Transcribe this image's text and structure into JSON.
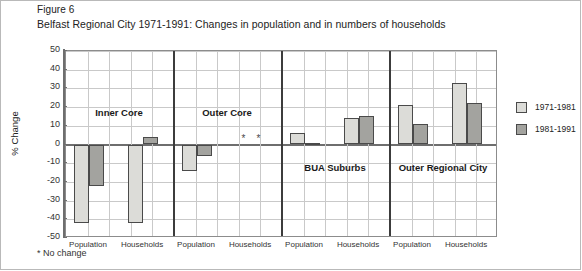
{
  "figure": {
    "number": "Figure 6",
    "title": "Belfast Regional City 1971-1991: Changes in population and in numbers of households",
    "footnote": "* No change"
  },
  "chart_data": {
    "type": "bar",
    "title": "Belfast Regional City 1971-1991: Changes in population and in numbers of households",
    "xlabel": "",
    "ylabel": "% Change",
    "ylim": [
      -50,
      50
    ],
    "ytick_step": 10,
    "yticks": [
      50,
      40,
      30,
      20,
      10,
      0,
      -10,
      -20,
      -30,
      -40,
      -50
    ],
    "grid": true,
    "legend_position": "right",
    "series": [
      {
        "name": "1971-1981",
        "color": "#dcdcd8"
      },
      {
        "name": "1981-1991",
        "color": "#a3a39f"
      }
    ],
    "panels": [
      {
        "name": "Inner Core",
        "categories": [
          "Population",
          "Households"
        ],
        "values": [
          {
            "category": "Population",
            "1971-1981": -42,
            "1981-1991": -22
          },
          {
            "category": "Households",
            "1971-1981": -42,
            "1981-1991": 4
          }
        ]
      },
      {
        "name": "Outer Core",
        "categories": [
          "Population",
          "Households"
        ],
        "values": [
          {
            "category": "Population",
            "1971-1981": -14,
            "1981-1991": -6
          },
          {
            "category": "Households",
            "1971-1981": 0,
            "1981-1991": 0,
            "note": "*"
          }
        ]
      },
      {
        "name": "BUA Suburbs",
        "categories": [
          "Population",
          "Households"
        ],
        "values": [
          {
            "category": "Population",
            "1971-1981": 6,
            "1981-1991": 1
          },
          {
            "category": "Households",
            "1971-1981": 14,
            "1981-1991": 15
          }
        ]
      },
      {
        "name": "Outer Regional City",
        "categories": [
          "Population",
          "Households"
        ],
        "values": [
          {
            "category": "Population",
            "1971-1981": 21,
            "1981-1991": 11
          },
          {
            "category": "Households",
            "1971-1981": 33,
            "1981-1991": 22
          }
        ]
      }
    ],
    "annotations": [
      {
        "text": "*",
        "panel": "Outer Core",
        "category": "Households",
        "series": "1971-1981",
        "meaning": "No change"
      },
      {
        "text": "*",
        "panel": "Outer Core",
        "category": "Households",
        "series": "1981-1991",
        "meaning": "No change"
      }
    ]
  },
  "axis": {
    "tick_labels": [
      "50",
      "40",
      "30",
      "20",
      "10",
      "0",
      "-10",
      "-20",
      "-30",
      "-40",
      "-50"
    ],
    "y_title": "% Change"
  },
  "legend": {
    "items": [
      {
        "label": "1971-1981"
      },
      {
        "label": "1981-1991"
      }
    ]
  },
  "category_labels": [
    "Population",
    "Households",
    "Population",
    "Households",
    "Population",
    "Households",
    "Population",
    "Households"
  ],
  "group_labels": [
    "Inner Core",
    "Outer Core",
    "BUA Suburbs",
    "Outer Regional City"
  ]
}
